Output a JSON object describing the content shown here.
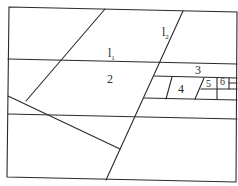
{
  "diagram": {
    "type": "partition-map",
    "line_color": "#2a2a2a",
    "background": "#ffffff",
    "lines": {
      "l1": {
        "base": "l",
        "sub": "1"
      },
      "l2": {
        "base": "l",
        "sub": "2"
      }
    },
    "regions": [
      {
        "id": "2",
        "label": "2"
      },
      {
        "id": "3",
        "label": "3"
      },
      {
        "id": "4",
        "label": "4"
      },
      {
        "id": "5",
        "label": "5"
      },
      {
        "id": "6",
        "label": "6"
      }
    ]
  }
}
